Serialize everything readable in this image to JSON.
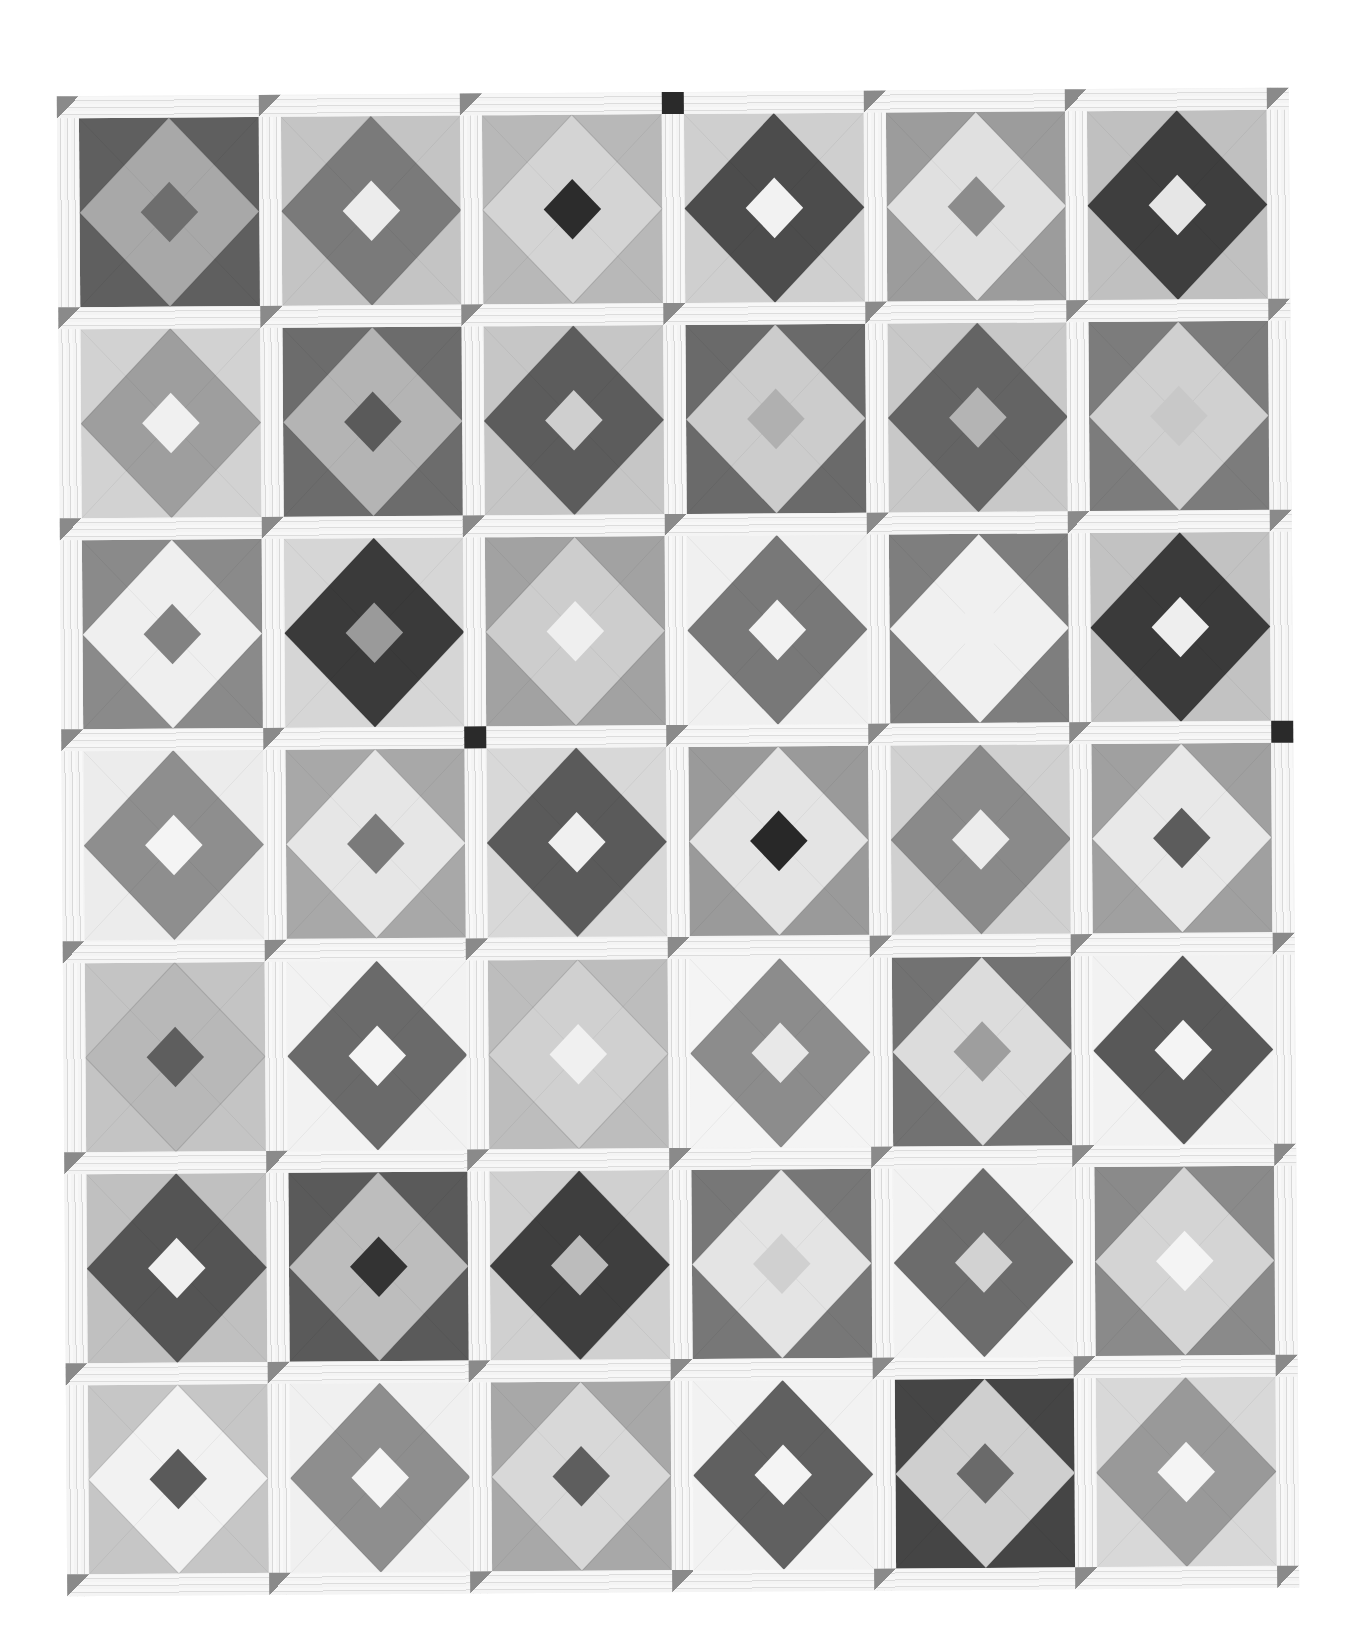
{
  "image": {
    "subject": "Black-and-white photograph of a pieced quilt",
    "pattern": "square-in-a-square blocks with sashing and cornerstones",
    "grid": {
      "columns": 6,
      "rows": 7
    }
  },
  "palette": {
    "sashing": "#f2f2f2",
    "cornerstone_default": "#8a8a8a",
    "cornerstone_dark": "#2a2a2a"
  },
  "blocks": [
    [
      {
        "corners": "#5f5f5f",
        "ring": "#a8a8a8",
        "center": "#6e6e6e"
      },
      {
        "corners": "#c4c4c4",
        "ring": "#7a7a7a",
        "center": "#ececec"
      },
      {
        "corners": "#b8b8b8",
        "ring": "#d4d4d4",
        "center": "#2c2c2c"
      },
      {
        "corners": "#cfcfcf",
        "ring": "#4c4c4c",
        "center": "#f2f2f2"
      },
      {
        "corners": "#9c9c9c",
        "ring": "#e0e0e0",
        "center": "#8c8c8c"
      },
      {
        "corners": "#c0c0c0",
        "ring": "#3e3e3e",
        "center": "#e6e6e6"
      }
    ],
    [
      {
        "corners": "#d2d2d2",
        "ring": "#9e9e9e",
        "center": "#f0f0f0"
      },
      {
        "corners": "#6c6c6c",
        "ring": "#b4b4b4",
        "center": "#5a5a5a"
      },
      {
        "corners": "#c6c6c6",
        "ring": "#5c5c5c",
        "center": "#cfcfcf"
      },
      {
        "corners": "#6a6a6a",
        "ring": "#cccccc",
        "center": "#b0b0b0"
      },
      {
        "corners": "#c8c8c8",
        "ring": "#646464",
        "center": "#b4b4b4"
      },
      {
        "corners": "#7c7c7c",
        "ring": "#d0d0d0",
        "center": "#c8c8c8"
      }
    ],
    [
      {
        "corners": "#8a8a8a",
        "ring": "#efefef",
        "center": "#828282"
      },
      {
        "corners": "#d6d6d6",
        "ring": "#3a3a3a",
        "center": "#9a9a9a"
      },
      {
        "corners": "#a2a2a2",
        "ring": "#cdcdcd",
        "center": "#efefef"
      },
      {
        "corners": "#f0f0f0",
        "ring": "#787878",
        "center": "#f2f2f2"
      },
      {
        "corners": "#7e7e7e",
        "ring": "#f0f0f0",
        "center": "#f0f0f0"
      },
      {
        "corners": "#c2c2c2",
        "ring": "#3a3a3a",
        "center": "#eeeeee"
      }
    ],
    [
      {
        "corners": "#ececec",
        "ring": "#8e8e8e",
        "center": "#f4f4f4"
      },
      {
        "corners": "#a8a8a8",
        "ring": "#e6e6e6",
        "center": "#7a7a7a"
      },
      {
        "corners": "#d8d8d8",
        "ring": "#5a5a5a",
        "center": "#f0f0f0"
      },
      {
        "corners": "#9a9a9a",
        "ring": "#e4e4e4",
        "center": "#282828"
      },
      {
        "corners": "#d0d0d0",
        "ring": "#8a8a8a",
        "center": "#ececec"
      },
      {
        "corners": "#a0a0a0",
        "ring": "#e8e8e8",
        "center": "#5c5c5c"
      }
    ],
    [
      {
        "corners": "#c4c4c4",
        "ring": "#b8b8b8",
        "center": "#5e5e5e"
      },
      {
        "corners": "#f2f2f2",
        "ring": "#6a6a6a",
        "center": "#f4f4f4"
      },
      {
        "corners": "#bdbdbd",
        "ring": "#d0d0d0",
        "center": "#f0f0f0"
      },
      {
        "corners": "#f4f4f4",
        "ring": "#8c8c8c",
        "center": "#e8e8e8"
      },
      {
        "corners": "#727272",
        "ring": "#dcdcdc",
        "center": "#9e9e9e"
      },
      {
        "corners": "#f2f2f2",
        "ring": "#585858",
        "center": "#f4f4f4"
      }
    ],
    [
      {
        "corners": "#c0c0c0",
        "ring": "#545454",
        "center": "#f0f0f0"
      },
      {
        "corners": "#5a5a5a",
        "ring": "#bdbdbd",
        "center": "#333333"
      },
      {
        "corners": "#d0d0d0",
        "ring": "#3e3e3e",
        "center": "#bcbcbc"
      },
      {
        "corners": "#777777",
        "ring": "#e4e4e4",
        "center": "#d0d0d0"
      },
      {
        "corners": "#f2f2f2",
        "ring": "#6c6c6c",
        "center": "#d2d2d2"
      },
      {
        "corners": "#8a8a8a",
        "ring": "#d4d4d4",
        "center": "#f4f4f4"
      }
    ],
    [
      {
        "corners": "#c6c6c6",
        "ring": "#f2f2f2",
        "center": "#5a5a5a"
      },
      {
        "corners": "#f0f0f0",
        "ring": "#8e8e8e",
        "center": "#f4f4f4"
      },
      {
        "corners": "#a8a8a8",
        "ring": "#d8d8d8",
        "center": "#5e5e5e"
      },
      {
        "corners": "#f2f2f2",
        "ring": "#606060",
        "center": "#f4f4f4"
      },
      {
        "corners": "#454545",
        "ring": "#cfcfcf",
        "center": "#6a6a6a"
      },
      {
        "corners": "#d8d8d8",
        "ring": "#999999",
        "center": "#f4f4f4"
      }
    ]
  ],
  "cornerstones_dark": [
    [
      0,
      3
    ],
    [
      3,
      2
    ],
    [
      3,
      6
    ]
  ]
}
